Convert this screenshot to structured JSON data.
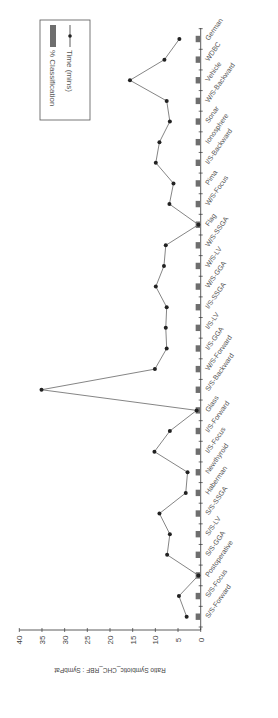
{
  "chart_data": {
    "type": "bar+line",
    "orientation": "rotated 90 degrees clockwise (page landscape figure)",
    "title": "",
    "ylabel": "Ratio Symbiotic_CHC_RBF : SymbPat",
    "xlabel": "",
    "ylim": [
      0,
      40
    ],
    "yticks": [
      0,
      5,
      10,
      15,
      20,
      25,
      30,
      35,
      40
    ],
    "grid": false,
    "legend_position": "upper right (in rotated frame)",
    "categories": [
      "S/S-Forward",
      "S/S-Focus",
      "Postoperative",
      "S/S-GGA",
      "S/S-LV",
      "S/S-SSGA",
      "Haberman",
      "Newthyroid",
      "I/S-Focus",
      "I/S-Forward",
      "Glass",
      "S/S-Backward",
      "W/S-Forward",
      "I/S-GGA",
      "I/S-LV",
      "I/S-SSGA",
      "W/S-GGA",
      "W/S-LV",
      "W/S-SSGA",
      "Flag",
      "W/S-Focus",
      "Pima",
      "I/S-Backward",
      "Ionosphere",
      "Sonar",
      "W/S-Backward",
      "Vehicle",
      "WDBC",
      "German"
    ],
    "series": [
      {
        "name": "% Classification",
        "type": "bar",
        "color": "#6e6e6e",
        "values": [
          1,
          1,
          1,
          1,
          1,
          1,
          1,
          1,
          1,
          1,
          1,
          1,
          1,
          1,
          1,
          1,
          1,
          1,
          1,
          1,
          1,
          1,
          1,
          1,
          1,
          1,
          1,
          1,
          1
        ]
      },
      {
        "name": "Time (mins)",
        "type": "line",
        "color": "#333333",
        "values": [
          3.1,
          4.8,
          0.5,
          7.4,
          6.8,
          9.1,
          3.3,
          2.9,
          10.2,
          6.8,
          0.9,
          35.1,
          10.1,
          7.5,
          7.7,
          7.5,
          9.9,
          8.1,
          7.7,
          0.5,
          6.9,
          6.0,
          9.9,
          9.1,
          6.8,
          7.5,
          15.6,
          8.0,
          4.7
        ]
      }
    ]
  },
  "legend": {
    "items": [
      {
        "label": "% Classification",
        "symbol": "bar"
      },
      {
        "label": "Time (mins)",
        "symbol": "line-marker"
      }
    ]
  },
  "axis": {
    "title": "Ratio Symbiotic_CHC_RBF : SymbPat",
    "tick_labels": [
      "0",
      "5",
      "10",
      "15",
      "20",
      "25",
      "30",
      "35",
      "40"
    ]
  }
}
